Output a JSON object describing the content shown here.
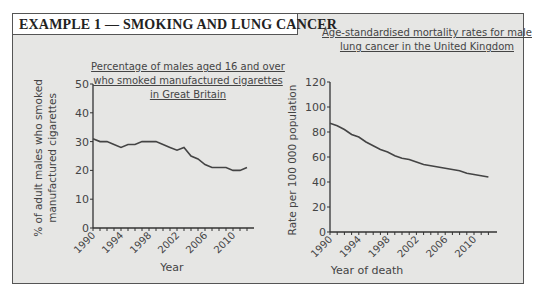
{
  "header": {
    "title": "EXAMPLE 1 — SMOKING AND LUNG CANCER"
  },
  "chart_data": [
    {
      "type": "line",
      "title": "Percentage of males aged 16 and over who smoked manufactured cigarettes in Great Britain",
      "title_lines": [
        "Percentage of males aged 16 and over",
        "who smoked manufactured cigarettes",
        "in Great Britain"
      ],
      "xlabel": "Year",
      "ylabel": "% of adult males who smoked manufactured cigarettes",
      "ylabel_lines": [
        "% of adult males who smoked",
        "manufactured cigarettes"
      ],
      "ylim": [
        0,
        50
      ],
      "yticks": [
        0,
        10,
        20,
        30,
        40,
        50
      ],
      "xticks": [
        "1990",
        "1994",
        "1998",
        "2002",
        "2006",
        "2010"
      ],
      "grid": false,
      "x": [
        1990,
        1991,
        1992,
        1993,
        1994,
        1995,
        1996,
        1997,
        1998,
        1999,
        2000,
        2001,
        2002,
        2003,
        2004,
        2005,
        2006,
        2007,
        2008,
        2009,
        2010,
        2011,
        2012
      ],
      "values": [
        31,
        30,
        30,
        29,
        28,
        29,
        29,
        30,
        30,
        30,
        29,
        28,
        27,
        28,
        25,
        24,
        22,
        21,
        21,
        21,
        20,
        20,
        21
      ]
    },
    {
      "type": "line",
      "title": "Age-standardised mortality rates for male lung cancer in the United Kingdom",
      "title_lines": [
        "Age-standardised mortality rates for male",
        "lung cancer in the United Kingdom"
      ],
      "xlabel": "Year of death",
      "ylabel": "Rate per 100 000 population",
      "ylim": [
        0,
        120
      ],
      "yticks": [
        0,
        20,
        40,
        60,
        80,
        100,
        120
      ],
      "xticks": [
        "1990",
        "1994",
        "1998",
        "2002",
        "2006",
        "2010"
      ],
      "grid": false,
      "x": [
        1990,
        1991,
        1992,
        1993,
        1994,
        1995,
        1996,
        1997,
        1998,
        1999,
        2000,
        2001,
        2002,
        2003,
        2004,
        2005,
        2006,
        2007,
        2008,
        2009,
        2010,
        2011,
        2012
      ],
      "values": [
        87,
        85,
        82,
        78,
        76,
        72,
        69,
        66,
        64,
        61,
        59,
        58,
        56,
        54,
        53,
        52,
        51,
        50,
        49,
        47,
        46,
        45,
        44
      ]
    }
  ]
}
